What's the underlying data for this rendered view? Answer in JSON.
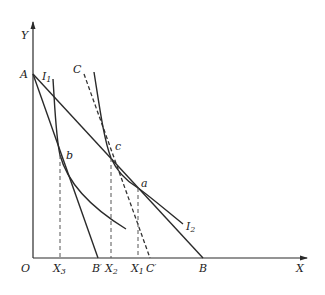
{
  "diagram": {
    "type": "indifference-curve / budget-line diagram",
    "colors": {
      "line": "#2a2a2a",
      "dashed": "#444444",
      "background": "#ffffff"
    },
    "axes": {
      "y_label": "Y",
      "x_label": "X",
      "origin_label": "O"
    },
    "points": {
      "A": "A",
      "a": "a",
      "b": "b",
      "c": "c"
    },
    "curves": {
      "I1": {
        "base": "I",
        "sub": "1"
      },
      "I2": {
        "base": "I",
        "sub": "2"
      },
      "C": "C"
    },
    "x_ticks": [
      {
        "base": "X",
        "sub": "3"
      },
      {
        "base": "B",
        "sub": "′"
      },
      {
        "base": "X",
        "sub": "2"
      },
      {
        "base": "X",
        "sub": "1"
      },
      {
        "base": "C",
        "sub": "′"
      },
      {
        "base": "B",
        "sub": ""
      }
    ],
    "lines": [
      {
        "name": "AB",
        "from": "A",
        "to": "B",
        "style": "solid"
      },
      {
        "name": "AB'",
        "from": "A",
        "to": "B'",
        "style": "solid"
      },
      {
        "name": "CC'",
        "from": "C",
        "to": "C'",
        "style": "dashed"
      }
    ],
    "projections": [
      {
        "from": "b",
        "to": "X3",
        "style": "dashed"
      },
      {
        "from": "c",
        "to": "X2",
        "style": "dashed"
      },
      {
        "from": "a",
        "to": "X1",
        "style": "dashed"
      }
    ]
  }
}
